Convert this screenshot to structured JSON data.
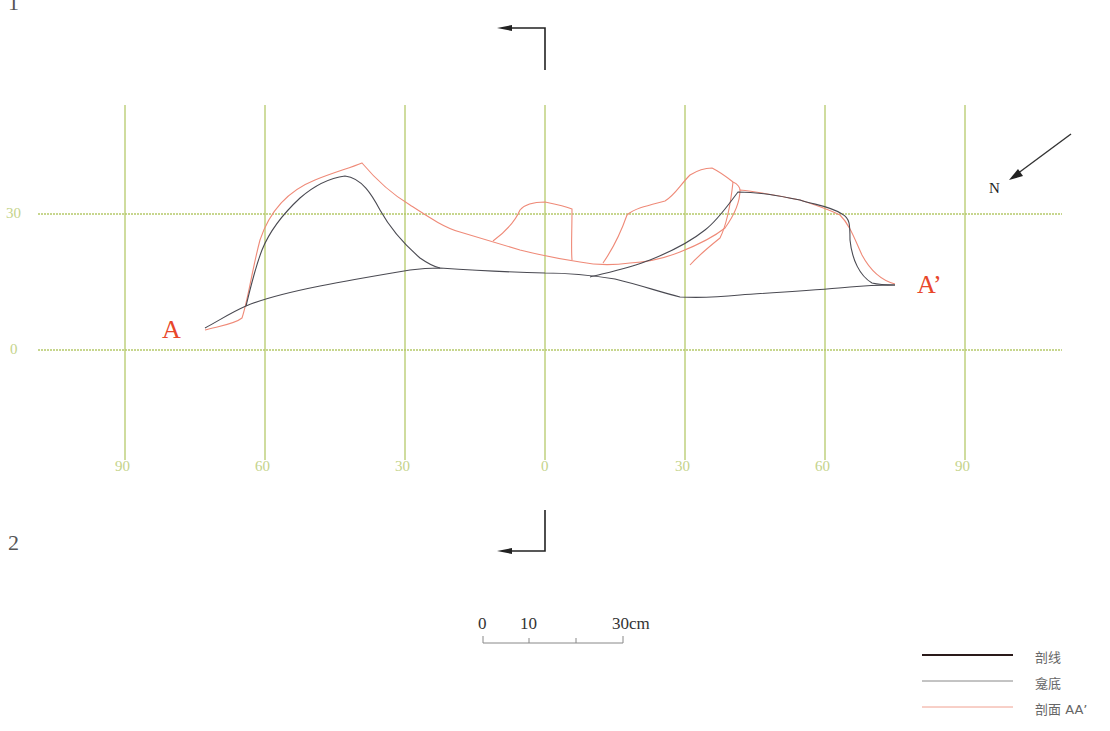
{
  "sheet": {
    "top_number": "1",
    "bottom_number": "2"
  },
  "grid": {
    "color": "#b5c96a",
    "x_labels": [
      "90",
      "60",
      "30",
      "0",
      "30",
      "60",
      "90"
    ],
    "y_labels": [
      "30",
      "0"
    ]
  },
  "section_markers": {
    "start_label": "A",
    "end_label": "A’",
    "color": "#e8472a"
  },
  "north_arrow": {
    "label": "N"
  },
  "scale_bar": {
    "labels": [
      "0",
      "10",
      "30cm"
    ]
  },
  "legend": {
    "items": [
      {
        "label": "剖线",
        "color": "#2a1a1a",
        "weight": 2
      },
      {
        "label": "龛底",
        "color": "#777777",
        "weight": 1
      },
      {
        "label": "剖面 AA’",
        "color": "#f0a090",
        "weight": 1
      }
    ]
  },
  "colors": {
    "outline": "#4a4a52",
    "section": "#ef8a78",
    "arrow": "#222222"
  }
}
